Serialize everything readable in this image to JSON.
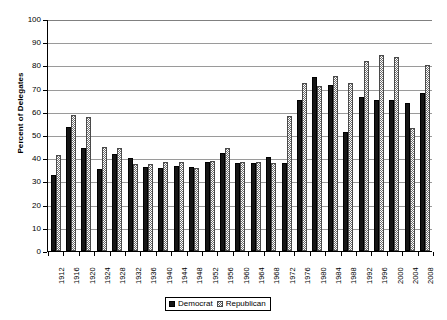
{
  "chart_data": {
    "type": "bar",
    "title": "",
    "xlabel": "",
    "ylabel": "Percent of Delegates",
    "ylim": [
      0,
      100
    ],
    "ytick_step": 10,
    "yticks": [
      0,
      10,
      20,
      30,
      40,
      50,
      60,
      70,
      80,
      90,
      100
    ],
    "grid": true,
    "legend_position": "bottom-center",
    "categories": [
      "1912",
      "1916",
      "1920",
      "1924",
      "1928",
      "1932",
      "1936",
      "1940",
      "1944",
      "1948",
      "1952",
      "1956",
      "1960",
      "1964",
      "1968",
      "1972",
      "1976",
      "1980",
      "1984",
      "1988",
      "1992",
      "1996",
      "2000",
      "2004",
      "2008"
    ],
    "series": [
      {
        "name": "Democrat",
        "color": "#151515",
        "pattern": "solid",
        "values": [
          32.8,
          53.3,
          44.4,
          35.4,
          41.8,
          40.0,
          36.4,
          35.7,
          36.6,
          36.0,
          38.4,
          42.3,
          38.0,
          38.0,
          40.5,
          38.0,
          65.0,
          75.0,
          71.5,
          51.5,
          66.5,
          65.0,
          65.0,
          64.0,
          68.0
        ]
      },
      {
        "name": "Republican",
        "color": "#dcdcdc",
        "pattern": "checkered",
        "values": [
          41.5,
          58.8,
          57.7,
          45.0,
          44.6,
          37.4,
          37.4,
          38.5,
          38.3,
          35.8,
          38.7,
          44.3,
          38.2,
          38.2,
          38.0,
          58.0,
          72.5,
          71.0,
          75.5,
          72.5,
          82.0,
          84.5,
          83.5,
          53.0,
          80.0
        ]
      }
    ]
  },
  "legend": {
    "items": [
      {
        "label": "Democrat"
      },
      {
        "label": "Republican"
      }
    ]
  }
}
